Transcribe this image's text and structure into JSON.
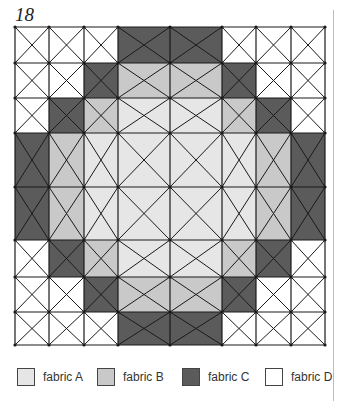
{
  "figure": {
    "number": "18"
  },
  "colors": {
    "A": "#e6e6e6",
    "B": "#c9c9c9",
    "C": "#5b5b5b",
    "D": "#ffffff",
    "line": "#1a1a1a"
  },
  "grid": {
    "col_edges": [
      15,
      49,
      84,
      118,
      170,
      222,
      256,
      291,
      325
    ],
    "row_edges": [
      27,
      63,
      98,
      133,
      187,
      240,
      277,
      312,
      345
    ],
    "cells": [
      [
        "D",
        "D",
        "D",
        "C",
        "C",
        "D",
        "D",
        "D"
      ],
      [
        "D",
        "D",
        "C",
        "B",
        "B",
        "C",
        "D",
        "D"
      ],
      [
        "D",
        "C",
        "B",
        "A",
        "A",
        "B",
        "C",
        "D"
      ],
      [
        "C",
        "B",
        "A",
        "A",
        "A",
        "A",
        "B",
        "C"
      ],
      [
        "C",
        "B",
        "A",
        "A",
        "A",
        "A",
        "B",
        "C"
      ],
      [
        "D",
        "C",
        "B",
        "A",
        "A",
        "B",
        "C",
        "D"
      ],
      [
        "D",
        "D",
        "C",
        "B",
        "B",
        "C",
        "D",
        "D"
      ],
      [
        "D",
        "D",
        "D",
        "C",
        "C",
        "D",
        "D",
        "D"
      ]
    ]
  },
  "legend": [
    {
      "key": "A",
      "label": "fabric A",
      "x": 17
    },
    {
      "key": "B",
      "label": "fabric B",
      "x": 97
    },
    {
      "key": "C",
      "label": "fabric C",
      "x": 182
    },
    {
      "key": "D",
      "label": "fabric D",
      "x": 265
    }
  ]
}
